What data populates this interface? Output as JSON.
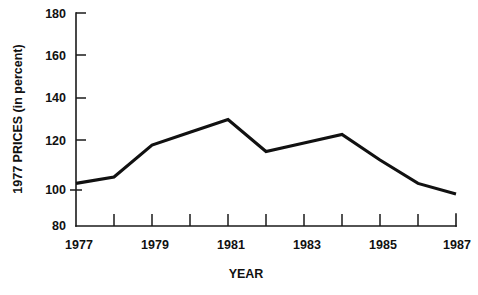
{
  "chart_data": {
    "type": "line",
    "title": "",
    "xlabel": "YEAR",
    "ylabel": "1977 PRICES (in percent)",
    "x": [
      1977,
      1978,
      1979,
      1980,
      1981,
      1982,
      1983,
      1984,
      1985,
      1986,
      1987
    ],
    "values": [
      100,
      103,
      118,
      124,
      130,
      115,
      119,
      123,
      111,
      100,
      95
    ],
    "series": [
      {
        "name": "1977 prices index",
        "values": [
          100,
          103,
          118,
          124,
          130,
          115,
          119,
          123,
          111,
          100,
          95
        ]
      }
    ],
    "xlim": [
      1977,
      1987
    ],
    "ylim": [
      80,
      180
    ],
    "y_ticks": [
      80,
      100,
      120,
      140,
      160,
      180
    ],
    "y_tick_labels": [
      "80",
      "100",
      "120",
      "140",
      "160",
      "180"
    ],
    "x_ticks": [
      1977,
      1978,
      1979,
      1980,
      1981,
      1982,
      1983,
      1984,
      1985,
      1986,
      1987
    ],
    "x_tick_labels": [
      "1977",
      "",
      "1979",
      "",
      "1981",
      "",
      "1983",
      "",
      "1985",
      "",
      "1987"
    ],
    "x_labeled_ticks": [
      "1977",
      "1979",
      "1981",
      "1983",
      "1985",
      "1987"
    ],
    "grid": false,
    "legend": "none",
    "line_color": "#111111"
  },
  "axes": {
    "y_axis_label": "1977 PRICES (in percent)",
    "x_axis_label": "YEAR",
    "y_ticks": [
      {
        "label": "180",
        "value": 180
      },
      {
        "label": "160",
        "value": 160
      },
      {
        "label": "140",
        "value": 140
      },
      {
        "label": "120",
        "value": 120
      },
      {
        "label": "100",
        "value": 100
      },
      {
        "label": "80",
        "value": 80
      }
    ],
    "x_ticks": [
      {
        "label": "1977",
        "value": 1977
      },
      {
        "label": "",
        "value": 1978
      },
      {
        "label": "1979",
        "value": 1979
      },
      {
        "label": "",
        "value": 1980
      },
      {
        "label": "1981",
        "value": 1981
      },
      {
        "label": "",
        "value": 1982
      },
      {
        "label": "1983",
        "value": 1983
      },
      {
        "label": "",
        "value": 1984
      },
      {
        "label": "1985",
        "value": 1985
      },
      {
        "label": "",
        "value": 1986
      },
      {
        "label": "1987",
        "value": 1987
      }
    ]
  }
}
